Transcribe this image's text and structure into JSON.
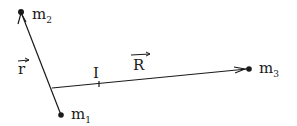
{
  "diagram": {
    "points": {
      "m1": {
        "label": "m",
        "sub": "1",
        "x": 61,
        "y": 115
      },
      "m2": {
        "label": "m",
        "sub": "2",
        "x": 21,
        "y": 12
      },
      "m3": {
        "label": "m",
        "sub": "3",
        "x": 248,
        "y": 69
      },
      "I": {
        "label": "I",
        "x": 99,
        "y": 84
      }
    },
    "vectors": {
      "r": {
        "label": "r",
        "from": "m1",
        "to": "m2"
      },
      "R": {
        "label": "R",
        "from": "I",
        "to": "m3"
      }
    },
    "colors": {
      "ink": "#1a1a1a",
      "background": "#ffffff"
    }
  }
}
